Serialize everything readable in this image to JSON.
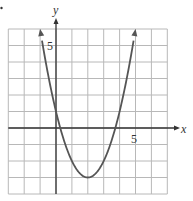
{
  "chart_data": {
    "type": "line",
    "title": "",
    "function": "y = x^2 - 4x + 1",
    "vertex": [
      2,
      -3
    ],
    "y_intercept": 1,
    "x_intercepts": [
      0.27,
      3.73
    ],
    "series": [
      {
        "name": "parabola",
        "x": [
          -1,
          -0.5,
          0,
          0.5,
          1,
          1.5,
          2,
          2.5,
          3,
          3.5,
          4,
          4.5,
          5
        ],
        "values": [
          6,
          3.25,
          1,
          -0.75,
          -2,
          -2.75,
          -3,
          -2.75,
          -2,
          -0.75,
          1,
          3.25,
          6
        ]
      }
    ],
    "xlabel": "x",
    "ylabel": "y",
    "xlim": [
      -3,
      7
    ],
    "ylim": [
      -4,
      6
    ],
    "x_tick_labels": [
      {
        "value": 5,
        "label": "5"
      }
    ],
    "y_tick_labels": [
      {
        "value": 5,
        "label": "5"
      }
    ],
    "grid": true,
    "grid_step": 1,
    "arrows_on_curve_ends": true,
    "legend": null
  },
  "axes": {
    "x_label": "x",
    "y_label": "y",
    "x_tick": "5",
    "y_tick": "5"
  },
  "colors": {
    "curve": "#555555",
    "axis": "#333333",
    "grid": "#b8b8b8"
  }
}
